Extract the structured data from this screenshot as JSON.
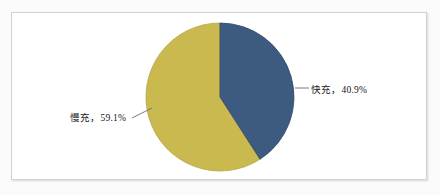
{
  "figure": {
    "background_color": "#fbfbfb",
    "panel_color": "#ffffff",
    "border_color": "#d2d2d2"
  },
  "labels": {
    "fast": "快充，40.9%",
    "slow": "慢充，59.1%"
  },
  "chart_data": {
    "type": "pie",
    "title": "",
    "categories": [
      "快充",
      "慢充"
    ],
    "values": [
      40.9,
      59.1
    ],
    "value_unit": "%",
    "labels": [
      "快充，40.9%",
      "慢充，59.1%"
    ],
    "colors": [
      "#3d5b80",
      "#c9b94f"
    ],
    "start_angle_deg": 90,
    "direction": "clockwise",
    "legend": "none",
    "data_labels": "outside-with-leader-lines",
    "grid": false,
    "series": [
      {
        "name": "充电方式占比",
        "slices": [
          {
            "label": "快充",
            "value": 40.9,
            "color": "#3d5b80"
          },
          {
            "label": "慢充",
            "value": 59.1,
            "color": "#c9b94f"
          }
        ]
      }
    ]
  }
}
